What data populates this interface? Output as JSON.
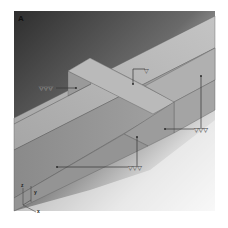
{
  "figure": {
    "panel_label": "A",
    "colors": {
      "background_dark": "#3a3a3a",
      "background_light": "#ffffff",
      "top_face": "#b4b4b4",
      "front_face": "#8e8e8e",
      "side_face": "#a2a2a2",
      "edge": "#5a5a5a"
    },
    "markers": [
      {
        "id": "left-arm",
        "symbol": "▽▽▽",
        "count": 3
      },
      {
        "id": "center-top",
        "symbol": "▽",
        "count": 1
      },
      {
        "id": "right-face",
        "symbol": "▽▽▽",
        "count": 3
      },
      {
        "id": "bottom-face",
        "symbol": "▽▽▽",
        "count": 3
      }
    ],
    "axes": {
      "z": "z",
      "y": "y",
      "x": "x"
    }
  }
}
